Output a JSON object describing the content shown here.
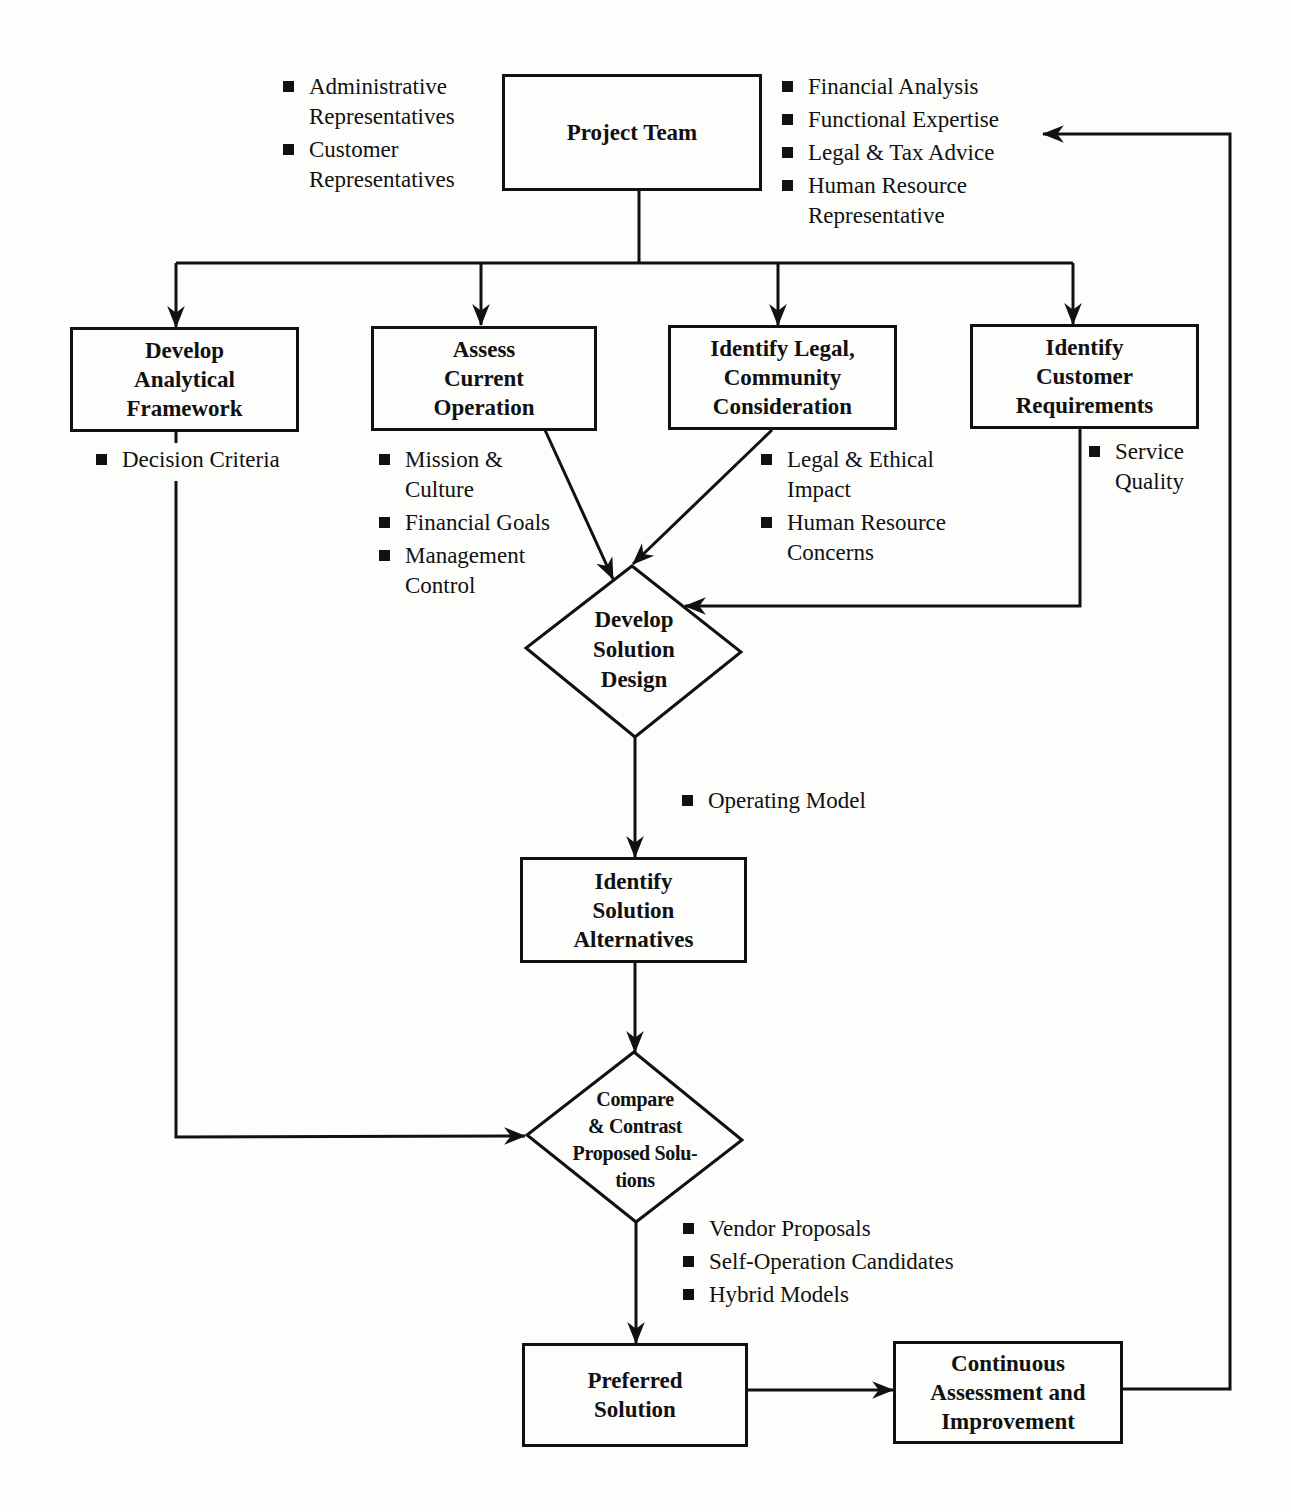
{
  "diagram": {
    "nodes": {
      "project_team": {
        "label": "Project Team"
      },
      "develop_framework": {
        "lines": [
          "Develop",
          "Analytical",
          "Framework"
        ]
      },
      "assess_operation": {
        "lines": [
          "Assess",
          "Current",
          "Operation"
        ]
      },
      "identify_legal": {
        "lines": [
          "Identify Legal,",
          "Community",
          "Consideration"
        ]
      },
      "identify_customer": {
        "lines": [
          "Identify",
          "Customer",
          "Requirements"
        ]
      },
      "develop_solution": {
        "lines": [
          "Develop",
          "Solution",
          "Design"
        ]
      },
      "identify_alternatives": {
        "lines": [
          "Identify",
          "Solution",
          "Alternatives"
        ]
      },
      "compare_contrast": {
        "lines": [
          "Compare",
          "& Contrast",
          "Proposed Solu-",
          "tions"
        ]
      },
      "preferred_solution": {
        "lines": [
          "Preferred",
          "Solution"
        ]
      },
      "continuous_assessment": {
        "lines": [
          "Continuous",
          "Assessment and",
          "Improvement"
        ]
      }
    },
    "annotations": {
      "project_team_left": [
        [
          "Administrative",
          "Representatives"
        ],
        [
          "Customer",
          "Representatives"
        ]
      ],
      "project_team_right": [
        [
          "Financial Analysis"
        ],
        [
          "Functional Expertise"
        ],
        [
          "Legal & Tax Advice"
        ],
        [
          "Human Resource",
          "Representative"
        ]
      ],
      "framework": [
        [
          "Decision Criteria"
        ]
      ],
      "operation": [
        [
          "Mission &",
          "Culture"
        ],
        [
          "Financial Goals"
        ],
        [
          "Management",
          "Control"
        ]
      ],
      "legal": [
        [
          "Legal & Ethical",
          "Impact"
        ],
        [
          "Human Resource",
          "Concerns"
        ]
      ],
      "customer": [
        [
          "Service",
          "Quality"
        ]
      ],
      "solution_design": [
        [
          "Operating Model"
        ]
      ],
      "compare": [
        [
          "Vendor Proposals"
        ],
        [
          "Self-Operation Candidates"
        ],
        [
          "Hybrid Models"
        ]
      ]
    },
    "colors": {
      "ink": "#111111",
      "paper": "#fdfdfc"
    }
  }
}
